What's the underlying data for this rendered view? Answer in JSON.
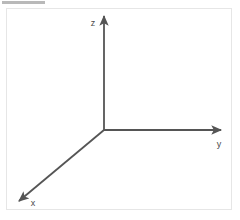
{
  "figure": {
    "title_bar_color": "#b9b9b9",
    "panel_border_color": "#e6e6e6",
    "background_color": "#ffffff",
    "axis_color": "#555555",
    "label_color": "#4a4a4a",
    "origin": {
      "x": 104,
      "y": 130
    },
    "axes": [
      {
        "id": "z",
        "label": "z",
        "direction": "up",
        "tip": {
          "x": 104,
          "y": 13
        },
        "label_pos": {
          "x": 93,
          "y": 26
        }
      },
      {
        "id": "y",
        "label": "y",
        "direction": "right",
        "tip": {
          "x": 224,
          "y": 130
        },
        "label_pos": {
          "x": 216,
          "y": 146
        }
      },
      {
        "id": "x",
        "label": "x",
        "direction": "down-left",
        "tip": {
          "x": 16,
          "y": 204
        },
        "label_pos": {
          "x": 30,
          "y": 206
        }
      }
    ]
  }
}
